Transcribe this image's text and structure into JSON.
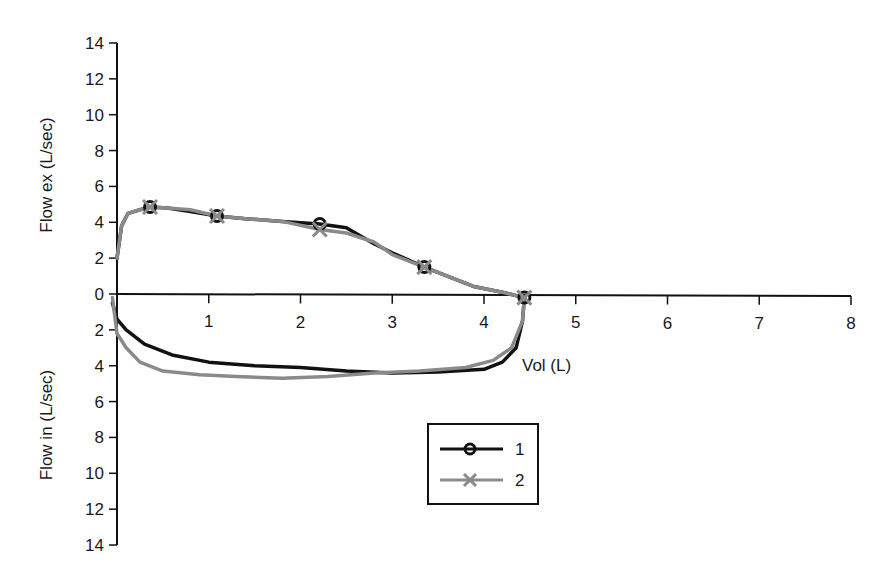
{
  "chart_data": {
    "type": "line",
    "title": "",
    "subtitle": "",
    "xlabel": "Vol (L)",
    "ylabel_upper": "Flow ex (L/sec)",
    "ylabel_lower": "Flow in (L/sec)",
    "xlim": [
      0,
      8
    ],
    "ylim_upper": [
      0,
      14
    ],
    "ylim_lower": [
      0,
      14
    ],
    "x_ticks": [
      1,
      2,
      3,
      4,
      5,
      6,
      7,
      8
    ],
    "y_ticks_upper": [
      14,
      12,
      10,
      8,
      6,
      4,
      2,
      0
    ],
    "y_ticks_lower": [
      2,
      4,
      6,
      8,
      10,
      12,
      14
    ],
    "grid": false,
    "legend_position": "lower-center box",
    "note": "Flow-volume loops; expiratory flow plotted above the volume axis, inspiratory flow plotted below (lower axis labels increase downward).",
    "series": [
      {
        "name": "1",
        "color": "#111111",
        "marker": "circle",
        "expiratory": {
          "x": [
            0.0,
            0.05,
            0.12,
            0.25,
            0.36,
            0.55,
            0.8,
            1.09,
            1.4,
            1.8,
            2.21,
            2.5,
            2.8,
            3.0,
            3.35,
            3.6,
            3.9,
            4.2,
            4.44
          ],
          "y": [
            2.0,
            3.8,
            4.5,
            4.7,
            4.85,
            4.8,
            4.6,
            4.35,
            4.2,
            4.05,
            3.9,
            3.7,
            2.8,
            2.3,
            1.5,
            1.0,
            0.4,
            0.1,
            -0.2
          ],
          "marker_points": [
            [
              0.36,
              4.85
            ],
            [
              1.09,
              4.35
            ],
            [
              2.21,
              3.9
            ],
            [
              3.35,
              1.5
            ],
            [
              4.44,
              -0.2
            ]
          ]
        },
        "inspiratory": {
          "x": [
            4.44,
            4.42,
            4.35,
            4.2,
            4.0,
            3.5,
            3.0,
            2.5,
            2.0,
            1.5,
            1.0,
            0.6,
            0.3,
            0.1,
            0.0,
            -0.05
          ],
          "y": [
            0.2,
            1.5,
            3.0,
            3.8,
            4.2,
            4.35,
            4.4,
            4.3,
            4.1,
            4.0,
            3.8,
            3.4,
            2.8,
            2.0,
            1.4,
            0.5
          ]
        }
      },
      {
        "name": "2",
        "color": "#8a8a8a",
        "marker": "x",
        "expiratory": {
          "x": [
            0.0,
            0.05,
            0.12,
            0.25,
            0.36,
            0.55,
            0.8,
            1.09,
            1.4,
            1.8,
            2.21,
            2.5,
            2.8,
            3.0,
            3.35,
            3.6,
            3.9,
            4.2,
            4.44
          ],
          "y": [
            2.0,
            3.8,
            4.5,
            4.7,
            4.85,
            4.8,
            4.7,
            4.35,
            4.2,
            4.05,
            3.6,
            3.4,
            2.9,
            2.2,
            1.5,
            1.0,
            0.4,
            0.1,
            -0.2
          ],
          "marker_points": [
            [
              0.36,
              4.85
            ],
            [
              1.09,
              4.35
            ],
            [
              2.21,
              3.6
            ],
            [
              3.35,
              1.5
            ],
            [
              4.44,
              -0.2
            ]
          ]
        },
        "inspiratory": {
          "x": [
            4.44,
            4.42,
            4.3,
            4.1,
            3.8,
            3.3,
            2.8,
            2.3,
            1.8,
            1.3,
            0.9,
            0.5,
            0.25,
            0.1,
            0.0,
            -0.05
          ],
          "y": [
            0.2,
            1.5,
            3.0,
            3.7,
            4.1,
            4.3,
            4.4,
            4.6,
            4.7,
            4.6,
            4.5,
            4.3,
            3.8,
            3.0,
            2.2,
            0.2
          ]
        }
      }
    ]
  },
  "legend": {
    "items": [
      {
        "label": "1",
        "color": "#111111",
        "marker": "circle"
      },
      {
        "label": "2",
        "color": "#8a8a8a",
        "marker": "x"
      }
    ]
  },
  "axes": {
    "x_title": "Vol (L)",
    "y_title_upper": "Flow ex (L/sec)",
    "y_title_lower": "Flow in (L/sec)"
  }
}
